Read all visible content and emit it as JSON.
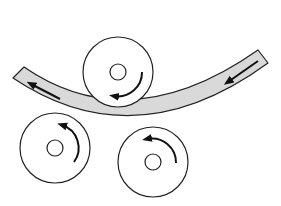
{
  "diagram": {
    "title": "",
    "type": "three-roll bending",
    "colors": {
      "background": "#ffffff",
      "stroke": "#222222",
      "strip_fill": "#d9d9d9",
      "arrow": "#111111"
    },
    "strip": {
      "label": "",
      "direction": "right-to-left"
    },
    "rollers": [
      {
        "id": "top",
        "cx": 118,
        "cy": 72,
        "r": 35,
        "hub_r": 8,
        "rotation": "clockwise"
      },
      {
        "id": "bottom-left",
        "cx": 55,
        "cy": 148,
        "r": 35,
        "hub_r": 8,
        "rotation": "counterclockwise"
      },
      {
        "id": "bottom-right",
        "cx": 153,
        "cy": 162,
        "r": 35,
        "hub_r": 8,
        "rotation": "counterclockwise"
      }
    ]
  }
}
